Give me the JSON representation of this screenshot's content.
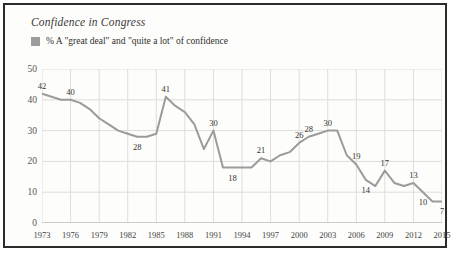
{
  "title": "Confidence in Congress",
  "legend": {
    "label": "% A \"great deal\" and \"quite a lot\" of confidence",
    "swatch_color": "#9d9d9d",
    "icon": "square-swatch-icon"
  },
  "colors": {
    "line": "#9b9b9b",
    "grid": "#dddddd",
    "axis": "#aaaaaa",
    "border": "#2b2b2b",
    "text": "#333333",
    "background": "#fdfdfb"
  },
  "chart_data": {
    "type": "line",
    "title": "Confidence in Congress",
    "xlabel": "",
    "ylabel": "",
    "ylim": [
      0,
      50
    ],
    "xlim": [
      1973,
      2015
    ],
    "yticks": [
      0,
      10,
      20,
      30,
      40,
      50
    ],
    "xticks": [
      1973,
      1976,
      1979,
      1982,
      1985,
      1988,
      1991,
      1994,
      1997,
      2000,
      2003,
      2006,
      2009,
      2012,
      2015
    ],
    "grid": true,
    "legend_position": "top-left",
    "series": [
      {
        "name": "% A \"great deal\" and \"quite a lot\" of confidence",
        "x": [
          1973,
          1974,
          1975,
          1976,
          1977,
          1978,
          1979,
          1980,
          1981,
          1982,
          1983,
          1984,
          1985,
          1986,
          1987,
          1988,
          1989,
          1990,
          1991,
          1992,
          1993,
          1994,
          1995,
          1996,
          1997,
          1998,
          1999,
          2000,
          2001,
          2002,
          2003,
          2004,
          2005,
          2006,
          2007,
          2008,
          2009,
          2010,
          2011,
          2012,
          2013,
          2014,
          2015
        ],
        "values": [
          42,
          41,
          40,
          40,
          39,
          37,
          34,
          32,
          30,
          29,
          28,
          28,
          29,
          41,
          38,
          36,
          32,
          24,
          30,
          18,
          18,
          18,
          18,
          21,
          20,
          22,
          23,
          26,
          28,
          29,
          30,
          30,
          22,
          19,
          14,
          12,
          17,
          13,
          12,
          13,
          10,
          7,
          7
        ]
      }
    ],
    "point_labels": [
      {
        "year": 1973,
        "value": 42,
        "text": "42"
      },
      {
        "year": 1976,
        "value": 40,
        "text": "40"
      },
      {
        "year": 1983,
        "value": 28,
        "text": "28"
      },
      {
        "year": 1986,
        "value": 41,
        "text": "41"
      },
      {
        "year": 1991,
        "value": 30,
        "text": "30"
      },
      {
        "year": 1993,
        "value": 18,
        "text": "18"
      },
      {
        "year": 1996,
        "value": 21,
        "text": "21"
      },
      {
        "year": 2001,
        "value": 28,
        "text": "28"
      },
      {
        "year": 2000,
        "value": 26,
        "text": "26"
      },
      {
        "year": 2003,
        "value": 30,
        "text": "30"
      },
      {
        "year": 2006,
        "value": 19,
        "text": "19"
      },
      {
        "year": 2007,
        "value": 14,
        "text": "14"
      },
      {
        "year": 2009,
        "value": 17,
        "text": "17"
      },
      {
        "year": 2012,
        "value": 13,
        "text": "13"
      },
      {
        "year": 2013,
        "value": 10,
        "text": "10"
      },
      {
        "year": 2015,
        "value": 7,
        "text": "7"
      }
    ]
  }
}
